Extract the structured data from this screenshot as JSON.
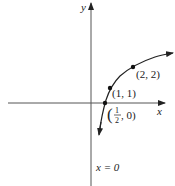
{
  "diagram": {
    "type": "function-graph",
    "axes": {
      "x_label": "x",
      "y_label": "y"
    },
    "asymptote_label": "x = 0",
    "points": [
      {
        "label": "(2, 2)",
        "x": 2,
        "y": 2
      },
      {
        "label": "(1, 1)",
        "x": 1,
        "y": 1
      },
      {
        "label_open": "(",
        "label_num": "1",
        "label_den": "2",
        "label_rest": ", 0)",
        "x": 0.5,
        "y": 0
      }
    ],
    "colors": {
      "line": "#222222",
      "background": "#ffffff"
    }
  }
}
